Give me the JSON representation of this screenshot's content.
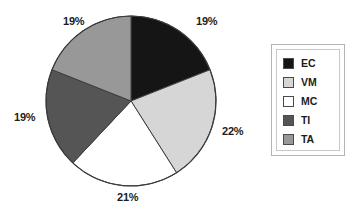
{
  "chart_data": {
    "type": "pie",
    "title": "",
    "legend_position": "right",
    "categories": [
      "EC",
      "VM",
      "MC",
      "TI",
      "TA"
    ],
    "values": [
      19,
      22,
      21,
      19,
      19
    ],
    "labels": [
      "19%",
      "22%",
      "21%",
      "19%",
      "19%"
    ],
    "colors": [
      "#151515",
      "#d6d6d6",
      "#ffffff",
      "#555555",
      "#989898"
    ],
    "start_angle_deg": 0,
    "direction": "clockwise",
    "slices": [
      {
        "name": "EC",
        "value": 19,
        "label": "19%",
        "color": "#151515"
      },
      {
        "name": "VM",
        "value": 22,
        "label": "22%",
        "color": "#d6d6d6"
      },
      {
        "name": "MC",
        "value": 21,
        "label": "21%",
        "color": "#ffffff"
      },
      {
        "name": "TI",
        "value": 19,
        "label": "19%",
        "color": "#555555"
      },
      {
        "name": "TA",
        "value": 19,
        "label": "19%",
        "color": "#989898"
      }
    ]
  },
  "pie": {
    "center_x": 131,
    "center_y": 101,
    "radius": 85,
    "outline_color": "#3c3c3c",
    "labels": [
      {
        "text": "19%",
        "x": 196,
        "y": 16
      },
      {
        "text": "22%",
        "x": 222,
        "y": 126
      },
      {
        "text": "21%",
        "x": 117,
        "y": 192
      },
      {
        "text": "19%",
        "x": 14,
        "y": 112
      },
      {
        "text": "19%",
        "x": 63,
        "y": 16
      }
    ]
  },
  "legend": {
    "items": [
      {
        "label": "EC",
        "color": "#151515"
      },
      {
        "label": "VM",
        "color": "#d6d6d6"
      },
      {
        "label": "MC",
        "color": "#ffffff"
      },
      {
        "label": "TI",
        "color": "#555555"
      },
      {
        "label": "TA",
        "color": "#989898"
      }
    ]
  }
}
